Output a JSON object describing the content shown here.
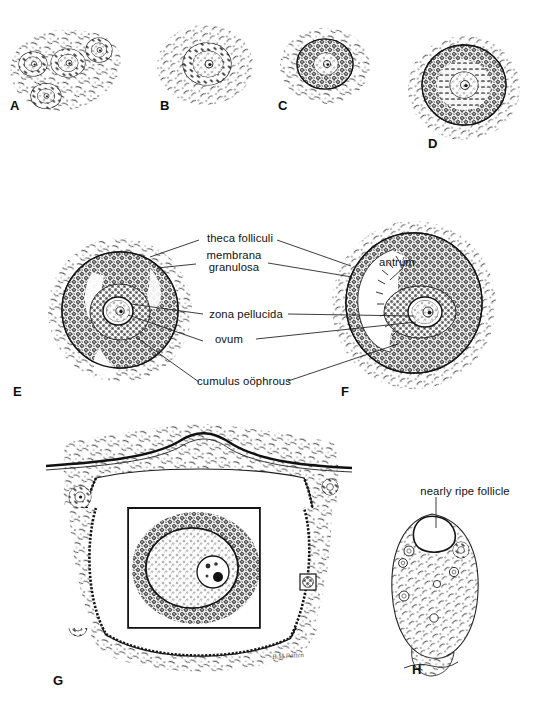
{
  "figure": {
    "kind": "histology-plate",
    "background_color": "#ffffff",
    "ink_color": "#1a1a1a",
    "signature": "B.M.Patten"
  },
  "panels": [
    {
      "id": "A",
      "letter": "A",
      "caption": "",
      "stage": "primordial follicles in ovarian cortex",
      "follicle_count": 4
    },
    {
      "id": "B",
      "letter": "B",
      "caption": "",
      "stage": "primary follicle, single layer of follicle cells",
      "follicle_count": 1
    },
    {
      "id": "C",
      "letter": "C",
      "caption": "",
      "stage": "primary follicle, growing",
      "follicle_count": 1
    },
    {
      "id": "D",
      "letter": "D",
      "caption": "",
      "stage": "multilaminar primary follicle with zona pellucida",
      "follicle_count": 1
    },
    {
      "id": "E",
      "letter": "E",
      "caption": "",
      "stage": "secondary follicle, antral spaces forming",
      "follicle_count": 1
    },
    {
      "id": "F",
      "letter": "F",
      "caption": "",
      "stage": "antral follicle with cumulus oophorus",
      "follicle_count": 1
    },
    {
      "id": "G",
      "letter": "G",
      "caption": "",
      "stage": "mature Graafian follicle with inset of ovum",
      "follicle_count": 1
    },
    {
      "id": "H",
      "letter": "H",
      "caption": "",
      "stage": "whole ovary showing nearly ripe follicle",
      "follicle_count": 1
    }
  ],
  "labels": {
    "theca_folliculi": "theca folliculi",
    "membrana_line1": "membrana",
    "membrana_line2": "granulosa",
    "zona_pellucida": "zona pellucida",
    "ovum": "ovum",
    "cumulus_oophrous": "cumulus oöphrous",
    "antrum": "antrum",
    "nearly_ripe_follicle": "nearly ripe follicle"
  }
}
